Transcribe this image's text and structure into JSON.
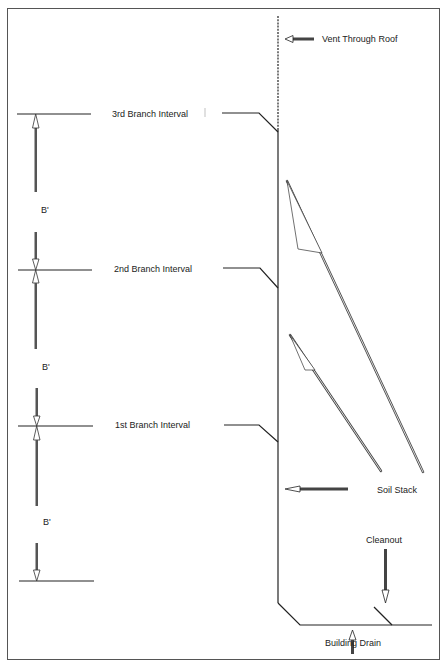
{
  "diagram": {
    "labels": {
      "vent_through_roof": "Vent Through Roof",
      "branch_3": "3rd Branch Interval",
      "branch_2": "2nd Branch Interval",
      "branch_1": "1st Branch Interval",
      "b_prime_1": "B'",
      "b_prime_2": "B'",
      "b_prime_3": "B'",
      "soil_stack": "Soil Stack",
      "cleanout": "Cleanout",
      "building_drain": "Building Drain"
    },
    "colors": {
      "line": "#222222",
      "frame": "#555555",
      "background": "#ffffff"
    }
  }
}
